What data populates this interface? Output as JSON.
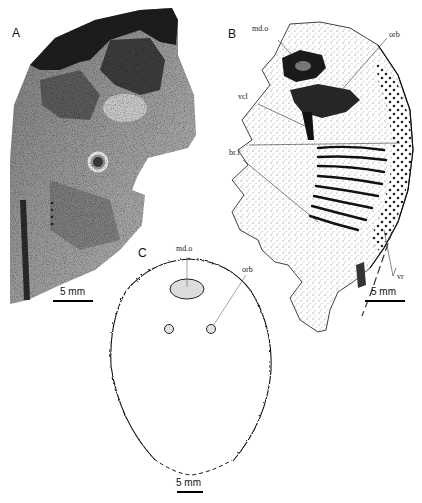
{
  "figure": {
    "panels": [
      {
        "id": "A",
        "letter": "A",
        "type": "photograph",
        "scale_bar": "5 mm"
      },
      {
        "id": "B",
        "letter": "B",
        "type": "stippled interpretive drawing",
        "labels": {
          "mdo": "md.o",
          "orb": "orb",
          "vcl": "vcl",
          "brf": "br.f",
          "vr": "vr"
        },
        "scale_bar": "5 mm"
      },
      {
        "id": "C",
        "letter": "C",
        "type": "outline reconstruction",
        "labels": {
          "mdo": "md.o",
          "orb": "orb"
        },
        "scale_bar": "5 mm"
      }
    ],
    "colors": {
      "line": "#000000",
      "fill_gray": "#d9d9d9",
      "photo_dark": "#2a2a2a",
      "photo_mid": "#8a8a8a",
      "photo_light": "#d0d0d0"
    }
  }
}
